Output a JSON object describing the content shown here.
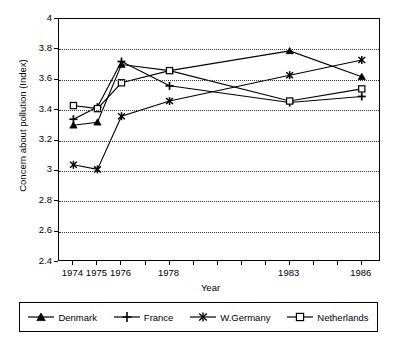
{
  "chart_data": {
    "type": "line",
    "title": "",
    "xlabel": "Year",
    "ylabel": "Concern about pollution (Index)",
    "x": [
      1974,
      1975,
      1976,
      1978,
      1983,
      1986
    ],
    "xlim": [
      1973.4,
      1986.8
    ],
    "ylim": [
      2.4,
      4.0
    ],
    "xtick_labels": [
      "1974",
      "1975",
      "1976",
      "1978",
      "1983",
      "1986"
    ],
    "ytick_labels": [
      "2.4",
      "2.6",
      "2.8",
      "3",
      "3.2",
      "3.4",
      "3.6",
      "3.8",
      "4"
    ],
    "ytick_values": [
      2.4,
      2.6,
      2.8,
      3.0,
      3.2,
      3.4,
      3.6,
      3.8,
      4.0
    ],
    "grid": "horizontal-dotted",
    "legend_position": "below-plot",
    "series": [
      {
        "name": "Denmark",
        "marker": "triangle",
        "color": "#000000",
        "values": [
          3.3,
          3.32,
          3.7,
          3.66,
          3.79,
          3.62
        ]
      },
      {
        "name": "France",
        "marker": "plus",
        "color": "#000000",
        "values": [
          3.34,
          3.42,
          3.72,
          3.56,
          3.45,
          3.49
        ]
      },
      {
        "name": "W.Germany",
        "marker": "asterisk",
        "color": "#000000",
        "values": [
          3.04,
          3.01,
          3.36,
          3.46,
          3.63,
          3.73
        ]
      },
      {
        "name": "Netherlands",
        "marker": "open-square",
        "color": "#000000",
        "values": [
          3.43,
          3.41,
          3.58,
          3.66,
          3.46,
          3.54
        ]
      }
    ]
  },
  "legend": {
    "items": [
      {
        "label": "Denmark",
        "marker": "triangle"
      },
      {
        "label": "France",
        "marker": "plus"
      },
      {
        "label": "W.Germany",
        "marker": "asterisk"
      },
      {
        "label": "Netherlands",
        "marker": "open-square"
      }
    ]
  }
}
